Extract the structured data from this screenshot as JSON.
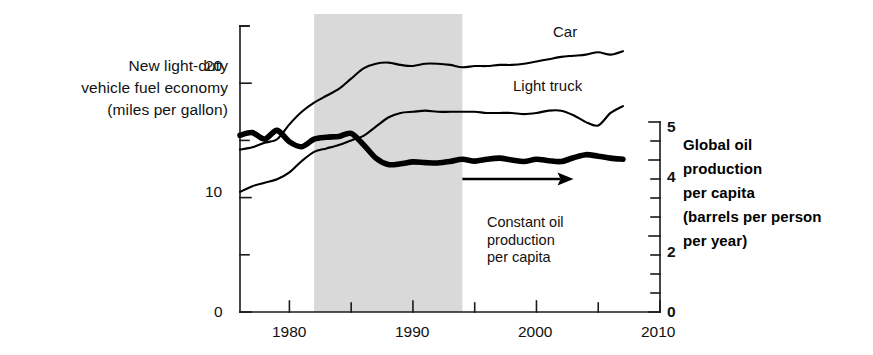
{
  "figure": {
    "left_axis_title": [
      "New light-duty",
      "vehicle fuel economy",
      "(miles per gallon)"
    ],
    "right_axis_title": [
      "Global oil",
      "production",
      "per capita",
      "(barrels per person",
      "per year)"
    ],
    "band_annotation": [
      "New vehicles",
      "phased in"
    ],
    "arrow_annotation": [
      "Constant oil",
      "production",
      "per capita"
    ],
    "series_tags": {
      "car": "Car",
      "light_truck": "Light truck"
    },
    "colors": {
      "line": "#000000",
      "band": "#d9d9d9",
      "axis": "#1a1a1a",
      "background": "#ffffff"
    },
    "left_ticks": [
      {
        "value": 0,
        "label": "0"
      },
      {
        "value": 5,
        "label": ""
      },
      {
        "value": 10,
        "label": "10"
      },
      {
        "value": 15,
        "label": ""
      },
      {
        "value": 20,
        "label": "20"
      },
      {
        "value": 25,
        "label": ""
      }
    ],
    "right_ticks": [
      {
        "value": 0,
        "label": "0"
      },
      {
        "value": 0.5,
        "label": ""
      },
      {
        "value": 1,
        "label": ""
      },
      {
        "value": 1.5,
        "label": ""
      },
      {
        "value": 2,
        "label": "2"
      },
      {
        "value": 2.5,
        "label": ""
      },
      {
        "value": 3,
        "label": ""
      },
      {
        "value": 3.5,
        "label": ""
      },
      {
        "value": 4,
        "label": "4"
      },
      {
        "value": 4.5,
        "label": ""
      },
      {
        "value": 5,
        "label": "5"
      }
    ],
    "x_ticks": [
      {
        "value": 1980,
        "label": "1980"
      },
      {
        "value": 1985,
        "label": ""
      },
      {
        "value": 1990,
        "label": "1990"
      },
      {
        "value": 1995,
        "label": ""
      },
      {
        "value": 2000,
        "label": "2000"
      },
      {
        "value": 2005,
        "label": ""
      },
      {
        "value": 2010,
        "label": "2010"
      }
    ]
  },
  "chart_data": {
    "type": "line",
    "title": "",
    "xlabel": "",
    "ylabel": "New light-duty vehicle fuel economy (miles per gallon)",
    "y2label": "Global oil production per capita (barrels per person per year)",
    "xlim": [
      1976,
      2010
    ],
    "ylim": [
      0,
      25
    ],
    "y2lim": [
      0,
      5
    ],
    "grid": false,
    "legend": "inline-labels",
    "shaded_region": {
      "label": "New vehicles phased in",
      "x_start": 1982,
      "x_end": 1994,
      "color": "#d9d9d9"
    },
    "annotations": [
      {
        "text": "Constant oil production per capita",
        "type": "arrow",
        "x_start": 1994,
        "x_end": 2003,
        "y_axis": "right",
        "y": 3.5
      }
    ],
    "series": [
      {
        "name": "Car",
        "axis": "left",
        "unit": "miles per gallon",
        "x": [
          1976,
          1977,
          1978,
          1979,
          1980,
          1981,
          1982,
          1983,
          1984,
          1985,
          1986,
          1987,
          1988,
          1989,
          1990,
          1991,
          1992,
          1993,
          1994,
          1995,
          1996,
          1997,
          1998,
          1999,
          2000,
          2001,
          2002,
          2003,
          2004,
          2005,
          2006,
          2007
        ],
        "values": [
          14.2,
          14.4,
          14.8,
          15.1,
          16.4,
          17.5,
          18.3,
          18.9,
          19.5,
          20.4,
          21.3,
          21.7,
          21.8,
          21.6,
          21.5,
          21.7,
          21.7,
          21.6,
          21.4,
          21.5,
          21.5,
          21.6,
          21.6,
          21.7,
          21.9,
          22.1,
          22.3,
          22.4,
          22.5,
          22.7,
          22.5,
          22.8
        ],
        "start_value": 14.2,
        "end_value": 22.8
      },
      {
        "name": "Light truck",
        "axis": "left",
        "unit": "miles per gallon",
        "x": [
          1976,
          1977,
          1978,
          1979,
          1980,
          1981,
          1982,
          1983,
          1984,
          1985,
          1986,
          1987,
          1988,
          1989,
          1990,
          1991,
          1992,
          1993,
          1994,
          1995,
          1996,
          1997,
          1998,
          1999,
          2000,
          2001,
          2002,
          2003,
          2004,
          2005,
          2006,
          2007
        ],
        "values": [
          10.5,
          11.0,
          11.3,
          11.6,
          12.2,
          13.2,
          14.0,
          14.3,
          14.6,
          15.0,
          15.4,
          16.2,
          17.0,
          17.4,
          17.5,
          17.6,
          17.5,
          17.5,
          17.5,
          17.5,
          17.4,
          17.4,
          17.4,
          17.3,
          17.4,
          17.6,
          17.6,
          17.2,
          16.6,
          16.3,
          17.4,
          18.0
        ],
        "start_value": 10.5,
        "end_value": 18.0
      },
      {
        "name": "Global oil production per capita",
        "axis": "right",
        "unit": "barrels per person per year",
        "emphasis": "thick",
        "x": [
          1976,
          1977,
          1978,
          1979,
          1980,
          1981,
          1982,
          1983,
          1984,
          1985,
          1986,
          1987,
          1988,
          1989,
          1990,
          1991,
          1992,
          1993,
          1994,
          1995,
          1996,
          1997,
          1998,
          1999,
          2000,
          2001,
          2002,
          2003,
          2004,
          2005,
          2006,
          2007
        ],
        "values": [
          4.65,
          4.72,
          4.55,
          4.78,
          4.48,
          4.35,
          4.55,
          4.6,
          4.62,
          4.7,
          4.4,
          4.05,
          3.88,
          3.9,
          3.95,
          3.93,
          3.92,
          3.96,
          4.02,
          3.97,
          4.02,
          4.05,
          4.0,
          3.96,
          4.02,
          3.98,
          3.96,
          4.06,
          4.14,
          4.1,
          4.05,
          4.02
        ],
        "start_value": 4.65,
        "end_value": 4.02
      }
    ]
  }
}
